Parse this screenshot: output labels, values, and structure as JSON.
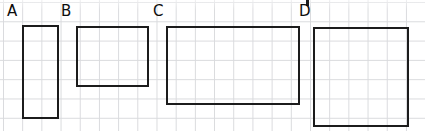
{
  "figure": {
    "title": "",
    "background_color": "#ffffff",
    "grid": {
      "visible": true,
      "line_color": "#d9dadd",
      "cell_width_px": 19.2,
      "cell_height_px": 19.3,
      "origin_x_px": 3,
      "origin_y_px": 2
    },
    "stroke_color": "#1c1c1c",
    "stroke_width_px": 2,
    "label_color": "#0d0d0d"
  },
  "chart_data": {
    "type": "diagram",
    "unit": "grid squares",
    "shapes": [
      {
        "label": "A",
        "kind": "rectangle",
        "x_px": 22,
        "y_px": 25,
        "width_px": 37,
        "height_px": 94,
        "width_cells": 2,
        "height_cells": 5,
        "area_cells": 10,
        "perimeter_cells": 14
      },
      {
        "label": "B",
        "kind": "rectangle",
        "x_px": 76,
        "y_px": 26,
        "width_px": 73,
        "height_px": 61,
        "width_cells": 4,
        "height_cells": 3,
        "area_cells": 12,
        "perimeter_cells": 14
      },
      {
        "label": "C",
        "kind": "rectangle",
        "x_px": 166,
        "y_px": 26,
        "width_px": 134,
        "height_px": 79,
        "width_cells": 7,
        "height_cells": 4,
        "area_cells": 28,
        "perimeter_cells": 22
      },
      {
        "label": "D",
        "kind": "rectangle",
        "x_px": 313,
        "y_px": 27,
        "width_px": 96,
        "height_px": 100,
        "width_cells": 5,
        "height_cells": 5,
        "area_cells": 25,
        "perimeter_cells": 20
      }
    ],
    "labels": [
      {
        "text": "A",
        "x_px": 7,
        "y_px": 4
      },
      {
        "text": "B",
        "x_px": 61,
        "y_px": 4
      },
      {
        "text": "C",
        "x_px": 153,
        "y_px": 4
      },
      {
        "text": "D",
        "x_px": 299,
        "y_px": 4
      }
    ]
  }
}
